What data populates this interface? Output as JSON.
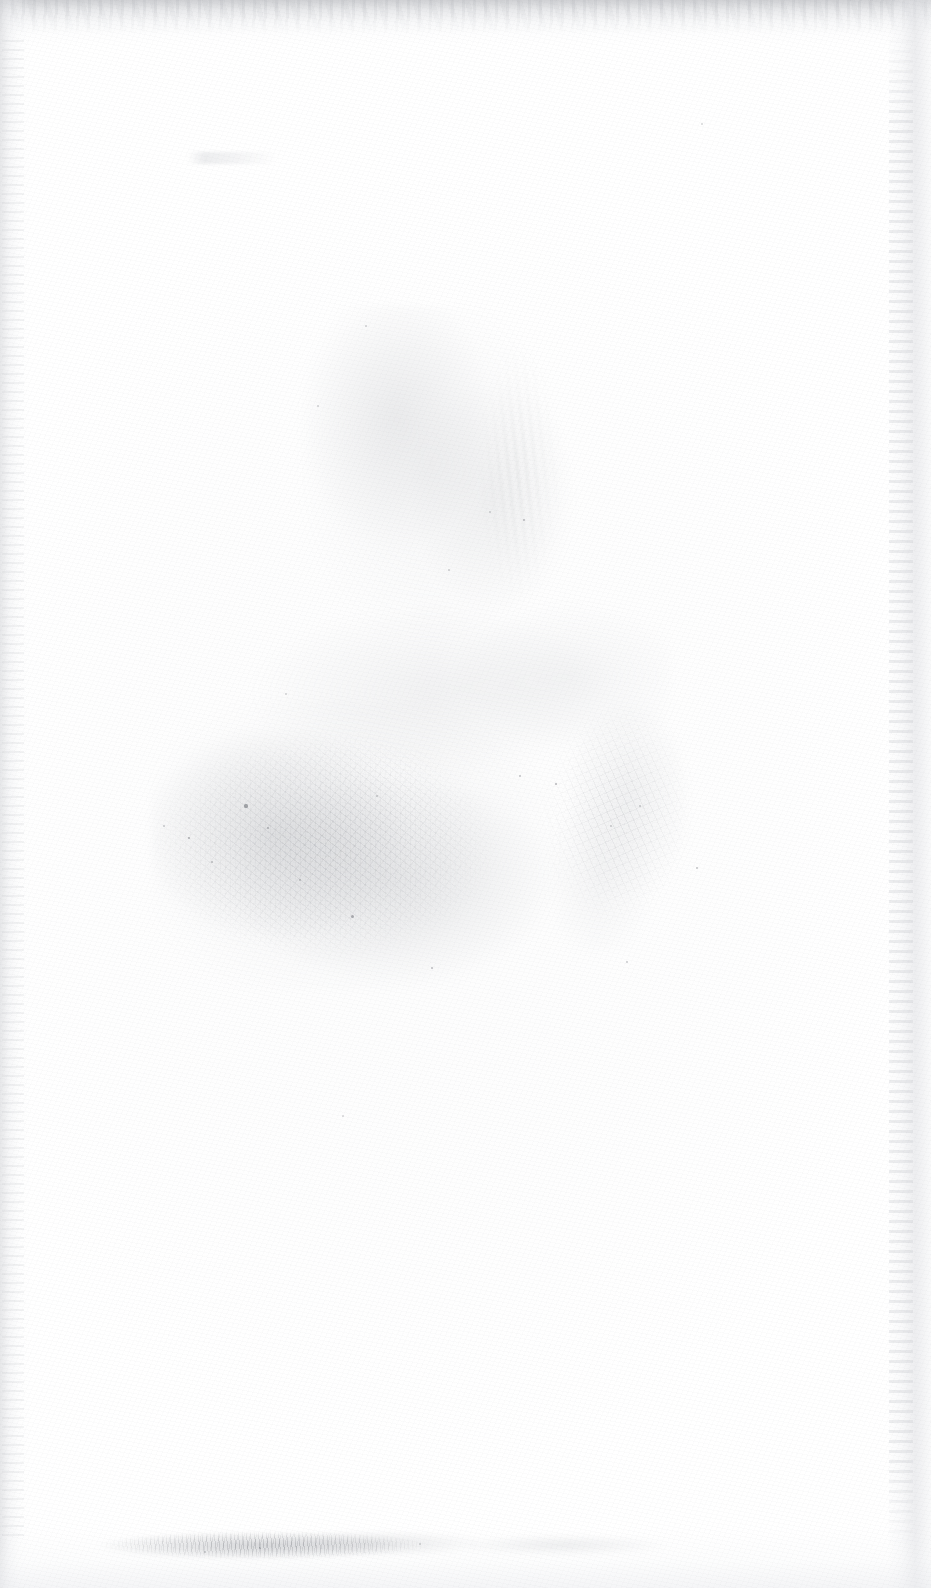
{
  "page": {
    "kind": "scanned-blank-page",
    "width": 931,
    "height": 1588,
    "text_content": "",
    "description": "Blank scanned page with no printed text or graphics",
    "background_color": "#ffffff"
  },
  "artifacts": {
    "top_edge": {
      "name": "top-edge-shadow",
      "color": "#cdced1",
      "height_px": 46
    },
    "left_edge": {
      "name": "left-edge-band",
      "color": "#d6d7da",
      "width_px": 30
    },
    "right_edge": {
      "name": "right-edge-band",
      "color": "#dedfe3",
      "width_px": 44
    },
    "bottom_edge": {
      "name": "bottom-edge-shadow",
      "color": "#ecedf0",
      "height_px": 60
    },
    "center_smudge": {
      "name": "central-smudge-cluster",
      "color": "#909399",
      "bounds": [
        150,
        300,
        560,
        700
      ]
    },
    "bottom_dirt_band": {
      "name": "bottom-dirt-band",
      "color": "#6a6d74",
      "bounds": [
        88,
        1524,
        390,
        42
      ]
    },
    "ghost_mark": {
      "name": "upper-ghost-mark",
      "color": "#c4c6cb",
      "bounds": [
        188,
        152,
        90,
        12
      ]
    }
  },
  "specks": [
    {
      "x": 246,
      "y": 806,
      "r": 1.6,
      "o": 0.5
    },
    {
      "x": 268,
      "y": 828,
      "r": 1.2,
      "o": 0.42
    },
    {
      "x": 189,
      "y": 838,
      "r": 1.4,
      "o": 0.45
    },
    {
      "x": 212,
      "y": 862,
      "r": 1.0,
      "o": 0.38
    },
    {
      "x": 352,
      "y": 916,
      "r": 1.5,
      "o": 0.48
    },
    {
      "x": 300,
      "y": 880,
      "r": 1.0,
      "o": 0.34
    },
    {
      "x": 432,
      "y": 968,
      "r": 1.2,
      "o": 0.4
    },
    {
      "x": 377,
      "y": 796,
      "r": 0.9,
      "o": 0.32
    },
    {
      "x": 520,
      "y": 776,
      "r": 1.1,
      "o": 0.36
    },
    {
      "x": 556,
      "y": 784,
      "r": 1.3,
      "o": 0.44
    },
    {
      "x": 640,
      "y": 806,
      "r": 1.0,
      "o": 0.34
    },
    {
      "x": 611,
      "y": 826,
      "r": 0.9,
      "o": 0.3
    },
    {
      "x": 697,
      "y": 868,
      "r": 1.1,
      "o": 0.36
    },
    {
      "x": 627,
      "y": 962,
      "r": 1.0,
      "o": 0.32
    },
    {
      "x": 524,
      "y": 520,
      "r": 1.3,
      "o": 0.4
    },
    {
      "x": 490,
      "y": 512,
      "r": 0.9,
      "o": 0.28
    },
    {
      "x": 449,
      "y": 570,
      "r": 1.0,
      "o": 0.3
    },
    {
      "x": 366,
      "y": 326,
      "r": 0.9,
      "o": 0.28
    },
    {
      "x": 318,
      "y": 406,
      "r": 0.9,
      "o": 0.26
    },
    {
      "x": 702,
      "y": 124,
      "r": 1.0,
      "o": 0.26
    },
    {
      "x": 164,
      "y": 826,
      "r": 1.0,
      "o": 0.32
    },
    {
      "x": 286,
      "y": 694,
      "r": 0.9,
      "o": 0.26
    },
    {
      "x": 343,
      "y": 1116,
      "r": 0.9,
      "o": 0.24
    },
    {
      "x": 260,
      "y": 1548,
      "r": 1.1,
      "o": 0.34
    },
    {
      "x": 205,
      "y": 1552,
      "r": 1.0,
      "o": 0.3
    },
    {
      "x": 420,
      "y": 1544,
      "r": 0.9,
      "o": 0.26
    }
  ]
}
